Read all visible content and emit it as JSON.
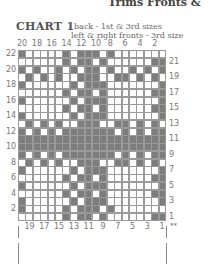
{
  "header_fragment": "Trims Fronts &",
  "chart": {
    "title": "CHART 1",
    "subtitle_line1": "back - 1st & 3rd sizes",
    "subtitle_line2": "left & right fronts - 3rd size",
    "top_col_labels": [
      "20",
      "18",
      "16",
      "14",
      "12",
      "10",
      "8",
      "6",
      "4",
      "2"
    ],
    "bottom_col_labels": [
      "19",
      "17",
      "15",
      "13",
      "11",
      "9",
      "7",
      "5",
      "3",
      "1"
    ],
    "left_row_labels": [
      "22",
      "20",
      "18",
      "16",
      "14",
      "12",
      "10",
      "8",
      "6",
      "4",
      "2"
    ],
    "right_row_labels": [
      "21",
      "19",
      "17",
      "15",
      "13",
      "11",
      "9",
      "7",
      "5",
      "3",
      "1"
    ],
    "marker": "**",
    "columns": 20,
    "rows": 22,
    "colors": {
      "dark": "#7d7d7d",
      "light": "#ffffff",
      "gridline": "#9a9a9a"
    },
    "grid": [
      "10000010111010000000",
      "00000010110100000011",
      "10100101011010010101",
      "01010100111001101010",
      "10000001011100000001",
      "00000010110100000011",
      "10000001011100000001",
      "00000010110100000011",
      "10000001011100000001",
      "01010100111001101010",
      "10101011111110101011",
      "11111111111111111111",
      "11111111111111111111",
      "10101011111110101011",
      "01010100111001101010",
      "10000001011100000001",
      "00000010110100000011",
      "10000001011100000001",
      "00000010110100000011",
      "10000001011100000001",
      "10000010111010000000",
      "00000010110100000011"
    ]
  }
}
